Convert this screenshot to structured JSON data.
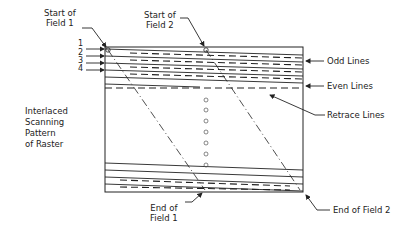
{
  "diagram": {
    "title": "Interlaced Scanning Pattern of Raster",
    "side_label_lines": [
      "Interlaced",
      "Scanning",
      "Pattern",
      "of Raster"
    ],
    "labels": {
      "start_field1": [
        "Start of",
        "Field 1"
      ],
      "start_field2": [
        "Start of",
        "Field 2"
      ],
      "odd_lines": "Odd Lines",
      "even_lines": "Even Lines",
      "retrace_lines": "Retrace Lines",
      "end_field1": [
        "End of",
        "Field 1"
      ],
      "end_field2": "End of Field 2"
    },
    "line_numbers": [
      "1",
      "2",
      "3",
      "4"
    ],
    "colors": {
      "stroke": "#222222",
      "background": "#ffffff"
    }
  }
}
